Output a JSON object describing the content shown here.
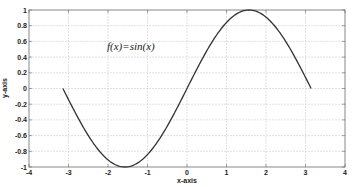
{
  "chart_data": {
    "type": "line",
    "title": "",
    "annotation": "f(x)=sin(x)",
    "xlabel": "x-axis",
    "ylabel": "y-axis",
    "xlim": [
      -4,
      4
    ],
    "ylim": [
      -1,
      1
    ],
    "grid": true,
    "xticks": [
      "-4",
      "-3",
      "-2",
      "-1",
      "0",
      "1",
      "2",
      "3",
      "4"
    ],
    "yticks": [
      "-1",
      "-0.8",
      "-0.6",
      "-0.4",
      "-0.2",
      "0",
      "0.2",
      "0.4",
      "0.6",
      "0.8",
      "1"
    ],
    "series": [
      {
        "name": "sin(x)",
        "function": "sin(x)",
        "x_range": [
          -3.1416,
          3.1416
        ],
        "x": [
          -3.1416,
          -2.618,
          -2.0944,
          -1.5708,
          -1.0472,
          -0.5236,
          0,
          0.5236,
          1.0472,
          1.5708,
          2.0944,
          2.618,
          3.1416
        ],
        "y": [
          0,
          -0.5,
          -0.866,
          -1,
          -0.866,
          -0.5,
          0,
          0.5,
          0.866,
          1,
          0.866,
          0.5,
          0
        ],
        "color": "#333333"
      }
    ]
  }
}
